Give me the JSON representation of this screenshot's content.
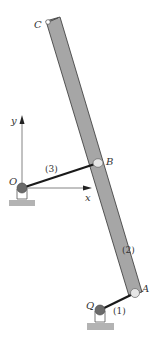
{
  "diagram": {
    "type": "mechanism linkage",
    "labels": {
      "C": "C",
      "B": "B",
      "A": "A",
      "O": "O",
      "Q": "Q",
      "x_axis": "x",
      "y_axis": "y",
      "link1": "(1)",
      "link2": "(2)",
      "link3": "(3)"
    },
    "colors": {
      "bar_fill": "#a6a6a6",
      "bar_stroke": "#333333",
      "link_stroke": "#1a1a1a",
      "pivot_fill": "#6b6b6b",
      "pin_fill": "#e6e6e6",
      "ground_fill": "#b3b3b3",
      "axis_stroke": "#555555"
    },
    "points": {
      "C": [
        52,
        19
      ],
      "B": [
        98,
        162
      ],
      "A": [
        135,
        293
      ],
      "O": [
        22,
        188
      ],
      "Q": [
        100,
        310
      ]
    }
  }
}
